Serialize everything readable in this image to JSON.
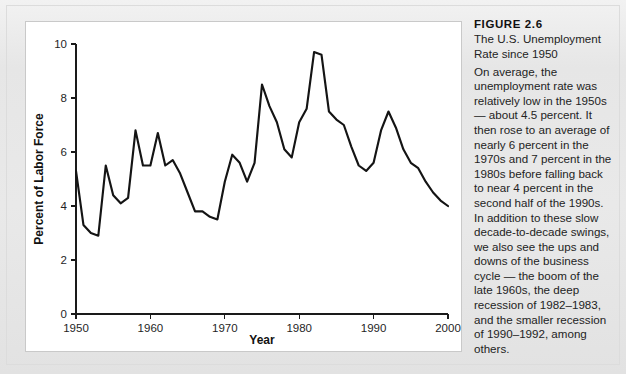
{
  "figure": {
    "heading": "FIGURE 2.6",
    "subtitle": "The U.S. Unemployment Rate since 1950",
    "body": "On average, the unemployment rate was relatively low in the 1950s — about 4.5 percent. It then rose to an average of nearly 6 percent in the 1970s and 7 percent in the 1980s before falling back to near 4 percent in the second half of the 1990s. In addition to these slow decade-to-decade swings, we also see the ups and downs of the business cycle — the boom of the late 1960s, the deep recession of 1982–1983, and the smaller recession of 1990–1992, among others."
  },
  "colors": {
    "page_background": "#e8e8e8",
    "panel_background": "#ffffff",
    "line": "#141414",
    "axis": "#1a1a1a",
    "text": "#232323"
  },
  "chart_data": {
    "type": "line",
    "title": "The U.S. Unemployment Rate since 1950",
    "xlabel": "Year",
    "ylabel": "Percent of Labor Force",
    "xlim": [
      1950,
      2000
    ],
    "ylim": [
      0,
      10
    ],
    "xticks": [
      1950,
      1960,
      1970,
      1980,
      1990,
      2000
    ],
    "yticks": [
      0,
      2,
      4,
      6,
      8,
      10
    ],
    "grid": false,
    "legend": false,
    "series": [
      {
        "name": "U.S. Unemployment Rate",
        "x": [
          1950,
          1951,
          1952,
          1953,
          1954,
          1955,
          1956,
          1957,
          1958,
          1959,
          1960,
          1961,
          1962,
          1963,
          1964,
          1965,
          1966,
          1967,
          1968,
          1969,
          1970,
          1971,
          1972,
          1973,
          1974,
          1975,
          1976,
          1977,
          1978,
          1979,
          1980,
          1981,
          1982,
          1983,
          1984,
          1985,
          1986,
          1987,
          1988,
          1989,
          1990,
          1991,
          1992,
          1993,
          1994,
          1995,
          1996,
          1997,
          1998,
          1999,
          2000
        ],
        "values": [
          5.3,
          3.3,
          3.0,
          2.9,
          5.5,
          4.4,
          4.1,
          4.3,
          6.8,
          5.5,
          5.5,
          6.7,
          5.5,
          5.7,
          5.2,
          4.5,
          3.8,
          3.8,
          3.6,
          3.5,
          4.9,
          5.9,
          5.6,
          4.9,
          5.6,
          8.5,
          7.7,
          7.1,
          6.1,
          5.8,
          7.1,
          7.6,
          9.7,
          9.6,
          7.5,
          7.2,
          7.0,
          6.2,
          5.5,
          5.3,
          5.6,
          6.8,
          7.5,
          6.9,
          6.1,
          5.6,
          5.4,
          4.9,
          4.5,
          4.2,
          4.0
        ]
      }
    ]
  }
}
